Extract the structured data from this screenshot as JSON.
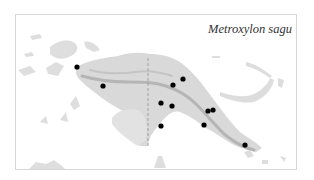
{
  "map": {
    "title": "Metroxylon sagu",
    "region": "New Guinea",
    "colors": {
      "background": "#ffffff",
      "frame": "#d6d6d6",
      "land": "#d9d9d9",
      "land_light": "#e6e6e6",
      "relief": "#b8b8b8",
      "border_line": "#9a9a9a",
      "occurrence": "#000000"
    },
    "occurrences": [
      {
        "x": 77,
        "y": 67
      },
      {
        "x": 103,
        "y": 86
      },
      {
        "x": 183,
        "y": 79
      },
      {
        "x": 173,
        "y": 85
      },
      {
        "x": 161,
        "y": 103
      },
      {
        "x": 172,
        "y": 106
      },
      {
        "x": 208,
        "y": 111
      },
      {
        "x": 213,
        "y": 110
      },
      {
        "x": 161,
        "y": 126
      },
      {
        "x": 204,
        "y": 125
      },
      {
        "x": 245,
        "y": 145
      }
    ]
  }
}
